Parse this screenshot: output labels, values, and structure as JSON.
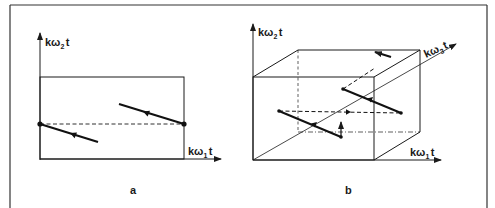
{
  "figure": {
    "colors": {
      "ink": "#1a1a1a",
      "background": "#ffffff",
      "frame": "#333333"
    },
    "panel_a": {
      "caption": "a",
      "y_axis_label": {
        "base": "kω",
        "sub": "2",
        "tail": "t"
      },
      "x_axis_label": {
        "base": "kω",
        "sub": "1",
        "tail": "t"
      }
    },
    "panel_b": {
      "caption": "b",
      "y_axis_label": {
        "base": "kω",
        "sub": "2",
        "tail": "t"
      },
      "x_axis_label": {
        "base": "kω",
        "sub": "1",
        "tail": "t"
      },
      "z_axis_label": {
        "base": "kω",
        "sub": "3",
        "tail": "t"
      }
    }
  }
}
